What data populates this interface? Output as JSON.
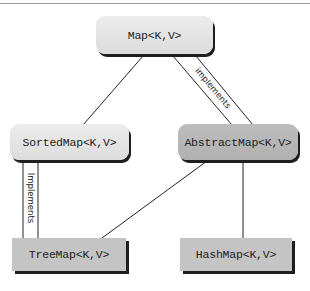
{
  "diagram": {
    "type": "class-hierarchy",
    "nodes": {
      "map": {
        "label": "Map<K,V>",
        "kind": "interface"
      },
      "sorted_map": {
        "label": "SortedMap<K,V>",
        "kind": "interface"
      },
      "abstract_map": {
        "label": "AbstractMap<K,V>",
        "kind": "abstract-class"
      },
      "tree_map": {
        "label": "TreeMap<K,V>",
        "kind": "class"
      },
      "hash_map": {
        "label": "HashMap<K,V>",
        "kind": "class"
      }
    },
    "edges": [
      {
        "from": "Map<K,V>",
        "to": "SortedMap<K,V>",
        "type": "extends"
      },
      {
        "from": "Map<K,V>",
        "to": "AbstractMap<K,V>",
        "type": "implements",
        "label": "implements"
      },
      {
        "from": "SortedMap<K,V>",
        "to": "TreeMap<K,V>",
        "type": "implements",
        "label": "Implements"
      },
      {
        "from": "AbstractMap<K,V>",
        "to": "TreeMap<K,V>",
        "type": "extends"
      },
      {
        "from": "AbstractMap<K,V>",
        "to": "HashMap<K,V>",
        "type": "extends"
      }
    ],
    "labels": {
      "map_to_abstract": "implements",
      "sorted_to_tree": "Implements"
    },
    "colors": {
      "interface_fill": "#e4e4e4",
      "abstract_fill": "#b8b8b8",
      "class_fill": "#c4c4c4",
      "shadow": "#1e1e1e",
      "line": "#222222"
    }
  }
}
